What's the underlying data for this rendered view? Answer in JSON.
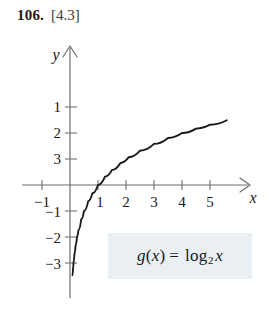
{
  "header": {
    "problem_number": "106.",
    "section_ref": "[4.3]"
  },
  "equation_box": {
    "function_name": "g",
    "argument_open": "(",
    "variable": "x",
    "argument_close": ")",
    "equals": "=",
    "log_word": "log",
    "log_base": "2",
    "log_argument": "x",
    "full_text": "g(x) = log₂ x",
    "background_color": "#e9eff3"
  },
  "chart_data": {
    "type": "line",
    "title": "",
    "xlabel": "x",
    "ylabel": "y",
    "function": "y = log_2(x)",
    "xlim": [
      -1.7,
      6.3
    ],
    "ylim": [
      -3.9,
      3.9
    ],
    "xticks": [
      -1,
      1,
      2,
      3,
      4,
      5
    ],
    "xtick_labels": [
      "−1",
      "1",
      "2",
      "3",
      "4",
      "5"
    ],
    "yticks": [
      -3,
      -2,
      -1,
      1,
      2,
      3
    ],
    "ytick_labels": [
      "−3",
      "−2",
      "−1",
      "1",
      "2",
      "3"
    ],
    "grid": false,
    "legend": "none",
    "axis_arrows": [
      "x-positive",
      "y-positive"
    ],
    "curve_color": "#1a1a1a",
    "axis_color": "#6e6e6e",
    "x": [
      0.09,
      0.11,
      0.13,
      0.16,
      0.2,
      0.25,
      0.3,
      0.4,
      0.5,
      0.65,
      0.8,
      1.0,
      1.25,
      1.5,
      1.8,
      2.1,
      2.5,
      3.0,
      3.5,
      4.0,
      4.5,
      5.0,
      5.6
    ],
    "y": [
      -3.47,
      -3.18,
      -2.94,
      -2.64,
      -2.32,
      -2.0,
      -1.74,
      -1.32,
      -1.0,
      -0.62,
      -0.32,
      0.0,
      0.32,
      0.58,
      0.85,
      1.07,
      1.32,
      1.58,
      1.81,
      2.0,
      2.17,
      2.32,
      2.49
    ]
  }
}
